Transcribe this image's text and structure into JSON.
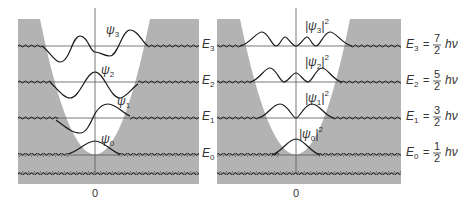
{
  "figure": {
    "colors": {
      "forbidden_region": "#b3b3b3",
      "well": "#ffffff",
      "curve": "#1a1a1a",
      "level_line": "#555555"
    },
    "left_panel": {
      "name": "wavefunctions",
      "x_tick": "0",
      "curves": [
        {
          "label": "ψ",
          "subscript": "3"
        },
        {
          "label": "ψ",
          "subscript": "2"
        },
        {
          "label": "ψ",
          "subscript": "1"
        },
        {
          "label": "ψ",
          "subscript": "0"
        }
      ],
      "level_labels": [
        {
          "label": "E",
          "subscript": "3"
        },
        {
          "label": "E",
          "subscript": "2"
        },
        {
          "label": "E",
          "subscript": "1"
        },
        {
          "label": "E",
          "subscript": "0"
        }
      ]
    },
    "right_panel": {
      "name": "probability-densities",
      "x_tick": "0",
      "curves": [
        {
          "label": "|ψ",
          "subscript": "3",
          "suffix": "|",
          "superscript": "2"
        },
        {
          "label": "|ψ",
          "subscript": "2",
          "suffix": "|",
          "superscript": "2"
        },
        {
          "label": "|ψ",
          "subscript": "1",
          "suffix": "|",
          "superscript": "2"
        },
        {
          "label": "|ψ",
          "subscript": "0",
          "suffix": "|",
          "superscript": "2"
        }
      ],
      "energy_equations": [
        {
          "E": "E",
          "subscript": "3",
          "eq": "=",
          "numerator": "7",
          "denominator": "2",
          "unit": "hν"
        },
        {
          "E": "E",
          "subscript": "2",
          "eq": "=",
          "numerator": "5",
          "denominator": "2",
          "unit": "hν"
        },
        {
          "E": "E",
          "subscript": "1",
          "eq": "=",
          "numerator": "3",
          "denominator": "2",
          "unit": "hν"
        },
        {
          "E": "E",
          "subscript": "0",
          "eq": "=",
          "numerator": "1",
          "denominator": "2",
          "unit": "hν"
        }
      ]
    }
  }
}
